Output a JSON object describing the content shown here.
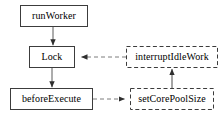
{
  "diagram": {
    "type": "flowchart",
    "title": "",
    "background_color": "#ffffff",
    "stroke_color": "#3c3c3c",
    "text_color": "#000000",
    "nodes": [
      {
        "id": "runWorker",
        "label": "runWorker",
        "shape": "rectangle",
        "border_style": "solid",
        "x": 20,
        "y": 5,
        "width": 68,
        "height": 22
      },
      {
        "id": "lock",
        "label": "Lock",
        "shape": "rectangle",
        "border_style": "solid",
        "x": 29,
        "y": 46,
        "width": 46,
        "height": 22
      },
      {
        "id": "beforeExecute",
        "label": "beforeExecute",
        "shape": "rectangle",
        "border_style": "solid",
        "x": 10,
        "y": 88,
        "width": 83,
        "height": 22
      },
      {
        "id": "interruptIdleWork",
        "label": "interruptIdleWork",
        "shape": "rectangle",
        "border_style": "dashed",
        "x": 126,
        "y": 46,
        "width": 92,
        "height": 22
      },
      {
        "id": "setCorePoolSize",
        "label": "setCorePoolSize",
        "shape": "rectangle",
        "border_style": "dashed",
        "x": 130,
        "y": 88,
        "width": 84,
        "height": 22
      }
    ],
    "edges": [
      {
        "id": "edge-runworker-lock",
        "from": "runWorker",
        "to": "lock",
        "line_style": "solid",
        "direction": "down",
        "arrowhead": "filled"
      },
      {
        "id": "edge-lock-beforeexecute",
        "from": "lock",
        "to": "beforeExecute",
        "line_style": "solid",
        "direction": "down",
        "arrowhead": "filled"
      },
      {
        "id": "edge-interruptidlework-lock",
        "from": "interruptIdleWork",
        "to": "lock",
        "line_style": "dashed",
        "direction": "left",
        "arrowhead": "filled"
      },
      {
        "id": "edge-beforeexecute-setcorepoolsize",
        "from": "beforeExecute",
        "to": "setCorePoolSize",
        "line_style": "dashed",
        "direction": "right",
        "arrowhead": "filled"
      },
      {
        "id": "edge-setcorepoolsize-interruptidlework",
        "from": "setCorePoolSize",
        "to": "interruptIdleWork",
        "line_style": "solid",
        "direction": "up",
        "arrowhead": "filled"
      }
    ]
  }
}
